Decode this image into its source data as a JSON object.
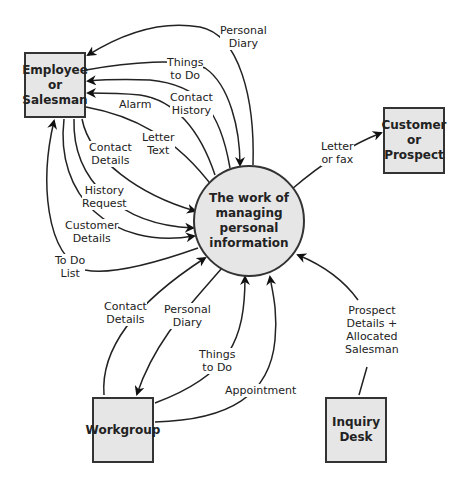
{
  "diagram": {
    "type": "data-flow-diagram",
    "process": {
      "label": "The work of\nmanaging\npersonal\ninformation"
    },
    "entities": [
      {
        "id": "employee",
        "label": "Employee\nor\nSalesman"
      },
      {
        "id": "customer",
        "label": "Customer\nor\nProspect"
      },
      {
        "id": "workgroup",
        "label": "Workgroup"
      },
      {
        "id": "inquiry",
        "label": "Inquiry\nDesk"
      }
    ],
    "flows": [
      {
        "from": "process",
        "to": "employee",
        "label": "Personal\nDiary"
      },
      {
        "from": "employee",
        "to": "process",
        "label": "Things\nto Do"
      },
      {
        "from": "process",
        "to": "employee",
        "label": "Contact\nHistory"
      },
      {
        "from": "process",
        "to": "employee",
        "label": "Alarm"
      },
      {
        "from": "employee",
        "to": "process",
        "label": "Letter\nText"
      },
      {
        "from": "employee",
        "to": "process",
        "label": "Contact\nDetails"
      },
      {
        "from": "employee",
        "to": "process",
        "label": "History\nRequest"
      },
      {
        "from": "employee",
        "to": "process",
        "label": "Customer\nDetails"
      },
      {
        "from": "process",
        "to": "employee",
        "label": "To Do\nList"
      },
      {
        "from": "process",
        "to": "customer",
        "label": "Letter\nor fax"
      },
      {
        "from": "workgroup",
        "to": "process",
        "label": "Contact\nDetails"
      },
      {
        "from": "process",
        "to": "workgroup",
        "label": "Personal\nDiary"
      },
      {
        "from": "workgroup",
        "to": "process",
        "label": "Things\nto Do"
      },
      {
        "from": "workgroup",
        "to": "process",
        "label": "Appointment"
      },
      {
        "from": "inquiry",
        "to": "process",
        "label": "Prospect\nDetails +\nAllocated\nSalesman"
      }
    ]
  }
}
